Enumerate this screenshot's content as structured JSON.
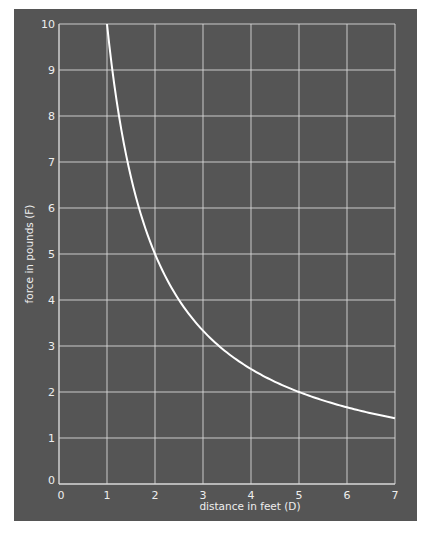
{
  "chart_data": {
    "type": "line",
    "title": "",
    "xlabel": "distance in feet (D)",
    "ylabel": "force in pounds (F)",
    "xlim": [
      0,
      7
    ],
    "ylim": [
      0,
      10
    ],
    "x_ticks": [
      0,
      1,
      2,
      3,
      4,
      5,
      6,
      7
    ],
    "y_ticks": [
      0,
      1,
      2,
      3,
      4,
      5,
      6,
      7,
      8,
      9,
      10
    ],
    "grid": true,
    "legend": null,
    "series": [
      {
        "name": "F = 10/D",
        "x": [
          1,
          1.25,
          1.5,
          2,
          2.5,
          3,
          3.5,
          4,
          4.5,
          5,
          5.5,
          6,
          6.5,
          7
        ],
        "y": [
          10,
          8,
          6.67,
          5,
          4,
          3.33,
          2.86,
          2.5,
          2.22,
          2,
          1.82,
          1.67,
          1.54,
          1.43
        ]
      }
    ],
    "colors": {
      "background": "#555555",
      "grid": "#d8d8d8",
      "curve": "#ffffff",
      "text": "#eeeeee"
    }
  }
}
